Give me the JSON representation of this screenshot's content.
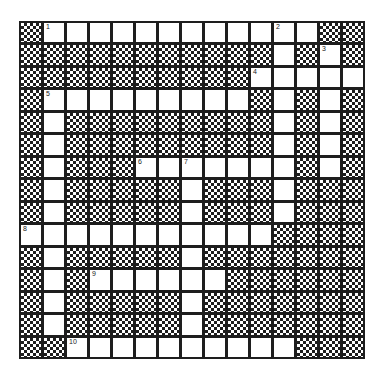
{
  "puzzle": {
    "rows": 15,
    "cols": 15,
    "layout": [
      "#############.#",
      "###############",
      "###############",
      "###############",
      "###############"
    ],
    "grid": [
      "#............##",
      "###########.#.#",
      "##########.....",
      "#.........#.#.#",
      "#.#########.#.#",
      "#.#########.#.#",
      "#.###.......#.#",
      "#.#####.###.###",
      "#.#####.###.###",
      "...........####",
      "#.#####.#######",
      "#.#......######",
      "#.#####.#######",
      "#.#####.#######",
      "##..........###"
    ],
    "numbers": [
      {
        "row": 0,
        "col": 1,
        "label": "1"
      },
      {
        "row": 0,
        "col": 11,
        "label": "2"
      },
      {
        "row": 1,
        "col": 13,
        "label": "3"
      },
      {
        "row": 2,
        "col": 10,
        "label": "4"
      },
      {
        "row": 3,
        "col": 1,
        "label": "5"
      },
      {
        "row": 6,
        "col": 5,
        "label": "6"
      },
      {
        "row": 6,
        "col": 7,
        "label": "7"
      },
      {
        "row": 9,
        "col": 0,
        "label": "8"
      },
      {
        "row": 11,
        "col": 3,
        "label": "9"
      },
      {
        "row": 14,
        "col": 2,
        "label": "10"
      }
    ],
    "colors": {
      "line": "#1e1e1e",
      "white_cell": "#ffffff",
      "block_pattern": "checkerboard"
    }
  }
}
